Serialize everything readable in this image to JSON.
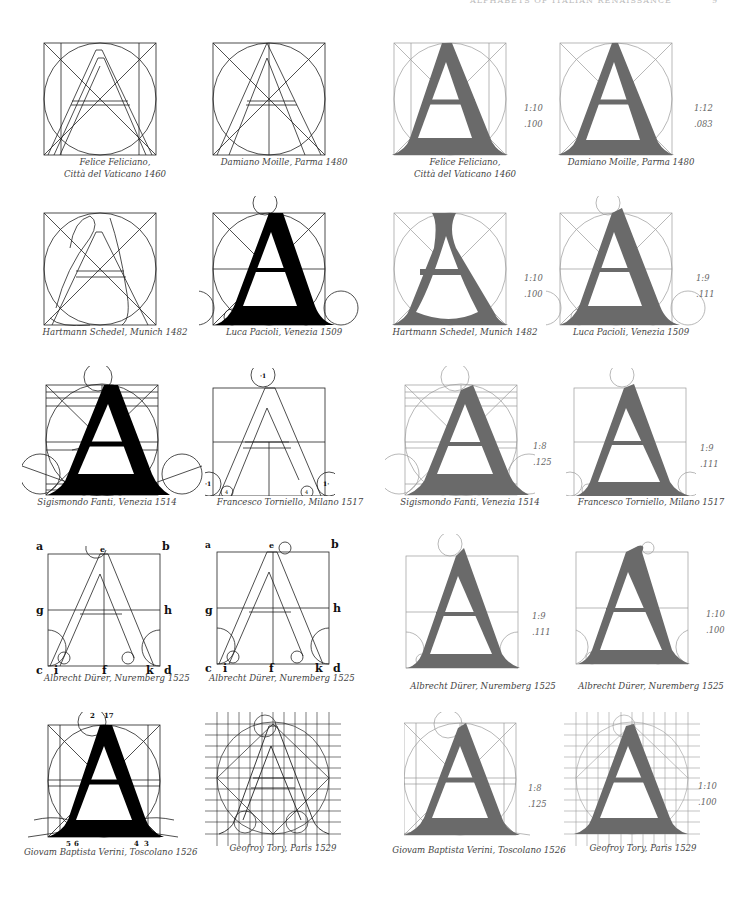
{
  "page": {
    "running_head": "ALPHABETS OF ITALIAN RENAISSANCE",
    "folio": "9"
  },
  "colors": {
    "outline_ink": "#222222",
    "solid_letter": "#000000",
    "shaded_letter": "#6a6a6a",
    "guide_lines": "#9a9a9a",
    "caption_text": "#444444"
  },
  "figures": [
    {
      "row": 0,
      "col": 0,
      "style": "outline",
      "caption": [
        "Felice Feliciano,",
        "Città del Vaticano 1460"
      ]
    },
    {
      "row": 0,
      "col": 1,
      "style": "outline",
      "caption": [
        "Damiano Moille, Parma 1480"
      ]
    },
    {
      "row": 0,
      "col": 2,
      "style": "shaded",
      "caption": [
        "Felice Feliciano,",
        "Città del Vaticano 1460"
      ],
      "ratio": "1:10",
      "decimal": ".100"
    },
    {
      "row": 0,
      "col": 3,
      "style": "shaded",
      "caption": [
        "Damiano Moille, Parma 1480"
      ],
      "ratio": "1:12",
      "decimal": ".083"
    },
    {
      "row": 1,
      "col": 0,
      "style": "outline",
      "caption": [
        "Hartmann Schedel, Munich 1482"
      ]
    },
    {
      "row": 1,
      "col": 1,
      "style": "solid",
      "caption": [
        "Luca Pacioli, Venezia 1509"
      ]
    },
    {
      "row": 1,
      "col": 2,
      "style": "shaded",
      "caption": [
        "Hartmann Schedel, Munich 1482"
      ],
      "ratio": "1:10",
      "decimal": ".100"
    },
    {
      "row": 1,
      "col": 3,
      "style": "shaded",
      "caption": [
        "Luca Pacioli, Venezia 1509"
      ],
      "ratio": "1:9",
      "decimal": ".111"
    },
    {
      "row": 2,
      "col": 0,
      "style": "solid",
      "caption": [
        "Sigismondo Fanti, Venezia 1514"
      ]
    },
    {
      "row": 2,
      "col": 1,
      "style": "outline",
      "caption": [
        "Francesco Torniello, Milano 1517"
      ],
      "marks": [
        "·1",
        "·1",
        "1·",
        "4",
        "4"
      ]
    },
    {
      "row": 2,
      "col": 2,
      "style": "shaded",
      "caption": [
        "Sigismondo Fanti, Venezia 1514"
      ],
      "ratio": "1:8",
      "decimal": ".125"
    },
    {
      "row": 2,
      "col": 3,
      "style": "shaded",
      "caption": [
        "Francesco Torniello, Milano 1517"
      ],
      "ratio": "1:9",
      "decimal": ".111"
    },
    {
      "row": 3,
      "col": 0,
      "style": "outline",
      "caption": [
        "Albrecht Dürer, Nuremberg 1525"
      ],
      "labels": {
        "tl": "a",
        "top": "e",
        "tr": "b",
        "ml": "g",
        "mr": "h",
        "bl": "c",
        "b1": "i",
        "bm": "f",
        "b2": "k",
        "br": "d"
      }
    },
    {
      "row": 3,
      "col": 1,
      "style": "outline",
      "caption": [
        "Albrecht Dürer, Nuremberg 1525"
      ],
      "labels": {
        "tl": "a",
        "top": "e",
        "tr": "b",
        "ml": "g",
        "mr": "h",
        "bl": "c",
        "b1": "i",
        "bm": "f",
        "b2": "k",
        "br": "d"
      }
    },
    {
      "row": 3,
      "col": 2,
      "style": "shaded",
      "caption": [
        "Albrecht Dürer, Nuremberg 1525"
      ],
      "ratio": "1:9",
      "decimal": ".111"
    },
    {
      "row": 3,
      "col": 3,
      "style": "shaded",
      "caption": [
        "Albrecht Dürer, Nuremberg 1525"
      ],
      "ratio": "1:10",
      "decimal": ".100"
    },
    {
      "row": 4,
      "col": 0,
      "style": "solid",
      "caption": [
        "Giovam Baptista Verini, Toscolano 1526"
      ],
      "numbers": {
        "top_left": "2",
        "top_right": "17",
        "b1": "5",
        "b2": "6",
        "b3": "4",
        "b4": "3"
      }
    },
    {
      "row": 4,
      "col": 1,
      "style": "outline",
      "caption": [
        "Geofroy Tory, Paris 1529"
      ]
    },
    {
      "row": 4,
      "col": 2,
      "style": "shaded",
      "caption": [
        "Giovam Baptista Verini, Toscolano 1526"
      ],
      "ratio": "1:8",
      "decimal": ".125"
    },
    {
      "row": 4,
      "col": 3,
      "style": "shaded",
      "caption": [
        "Geofroy Tory, Paris 1529"
      ],
      "ratio": "1:10",
      "decimal": ".100"
    }
  ]
}
